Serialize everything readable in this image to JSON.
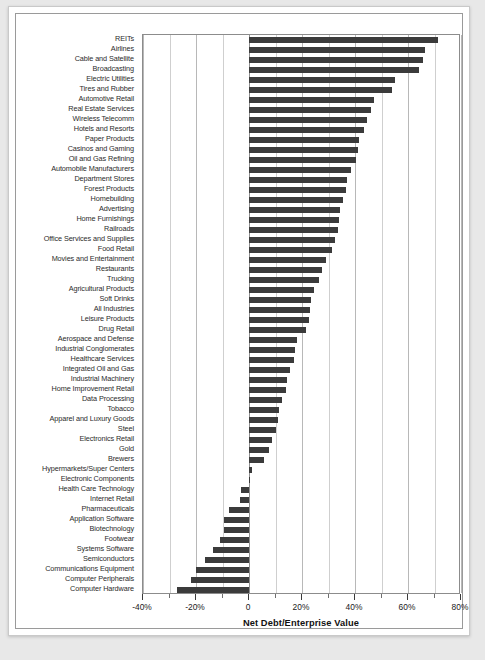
{
  "chart_data": {
    "type": "bar",
    "orientation": "horizontal",
    "title": "",
    "subtitle": "",
    "xlabel": "Net Debt/Enterprise Value",
    "ylabel": "",
    "xlim": [
      -40,
      80
    ],
    "xticks": [
      -40,
      -20,
      0,
      20,
      40,
      60,
      80
    ],
    "xtick_labels": [
      "-40%",
      "-20%",
      "0",
      "20%",
      "40%",
      "60%",
      "80%"
    ],
    "minor_gridline_step": 10,
    "grid": true,
    "legend": null,
    "bar_color": "#3b3b3b",
    "units": "percent",
    "categories": [
      "REITs",
      "Airlines",
      "Cable and Satellite",
      "Broadcasting",
      "Electric Utilities",
      "Tires and Rubber",
      "Automotive Retail",
      "Real Estate Services",
      "Wireless Telecomm",
      "Hotels and Resorts",
      "Paper Products",
      "Casinos and Gaming",
      "Oil and Gas Refining",
      "Automobile Manufacturers",
      "Department Stores",
      "Forest Products",
      "Homebuilding",
      "Advertising",
      "Home Furnishings",
      "Railroads",
      "Office Services and Supplies",
      "Food Retail",
      "Movies and Entertainment",
      "Restaurants",
      "Trucking",
      "Agricultural Products",
      "Soft Drinks",
      "All Industries",
      "Leisure Products",
      "Drug Retail",
      "Aerospace and Defense",
      "Industrial Conglomerates",
      "Healthcare Services",
      "Integrated Oil and Gas",
      "Industrial Machinery",
      "Home Improvement Retail",
      "Data Processing",
      "Tobacco",
      "Apparel and Luxury Goods",
      "Steel",
      "Electronics Retail",
      "Gold",
      "Brewers",
      "Hypermarkets/Super Centers",
      "Electronic Components",
      "Health Care Technology",
      "Internet Retail",
      "Pharmaceuticals",
      "Application Software",
      "Biotechnology",
      "Footwear",
      "Systems Software",
      "Semiconductors",
      "Communications Equipment",
      "Computer Peripherals",
      "Computer Hardware"
    ],
    "values": [
      71.5,
      66.5,
      65.5,
      64.0,
      55.0,
      54.0,
      47.0,
      46.0,
      44.5,
      43.5,
      41.5,
      41.0,
      40.5,
      38.5,
      37.0,
      36.5,
      35.5,
      34.5,
      34.0,
      33.5,
      32.5,
      31.5,
      29.0,
      27.5,
      26.5,
      24.5,
      23.5,
      23.0,
      22.5,
      21.5,
      18.0,
      17.5,
      17.0,
      15.5,
      14.5,
      14.0,
      12.5,
      11.5,
      11.0,
      10.0,
      8.5,
      7.5,
      5.5,
      1.0,
      0.5,
      -3.0,
      -3.5,
      -7.5,
      -9.5,
      -9.5,
      -11.0,
      -13.5,
      -16.5,
      -20.0,
      -22.0,
      -27.0
    ]
  },
  "figure": {
    "background_color": "#ffffff",
    "page_background_color": "#e8e8e8",
    "border_color": "#9a9a9a"
  }
}
